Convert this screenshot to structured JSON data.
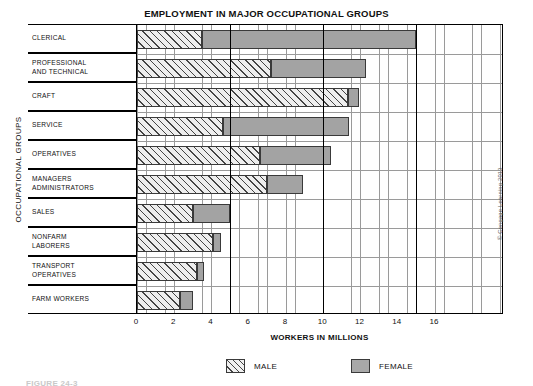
{
  "chart_data": {
    "type": "bar",
    "orientation": "horizontal",
    "title": "EMPLOYMENT IN MAJOR OCCUPATIONAL GROUPS",
    "xlabel": "WORKERS IN MILLIONS",
    "ylabel": "OCCUPATIONAL GROUPS",
    "xlim": [
      0,
      19.7
    ],
    "xticks": [
      0,
      2,
      4,
      6,
      8,
      10,
      12,
      14,
      16
    ],
    "xtick_labels": [
      "0",
      "2",
      "4",
      "6",
      "8",
      "10",
      "12",
      "14",
      "16"
    ],
    "major_gridlines": [
      5,
      10,
      15
    ],
    "minor_gridline_step": 0.5,
    "grid": true,
    "legend_position": "bottom",
    "categories": [
      "CLERICAL",
      "PROFESSIONAL\nAND TECHNICAL",
      "CRAFT",
      "SERVICE",
      "OPERATIVES",
      "MANAGERS\nADMINISTRATORS",
      "SALES",
      "NONFARM\nLABORERS",
      "TRANSPORT\nOPERATIVES",
      "FARM WORKERS"
    ],
    "series": [
      {
        "name": "MALE",
        "color": "#eeeeee",
        "pattern": "diagonal-hatch",
        "values": [
          3.5,
          7.2,
          11.3,
          4.6,
          6.6,
          7.0,
          3.0,
          4.1,
          3.2,
          2.3
        ]
      },
      {
        "name": "FEMALE",
        "color": "#a3a3a3",
        "pattern": "solid-gray",
        "values": [
          15.0,
          12.3,
          11.9,
          11.4,
          10.4,
          8.9,
          5.0,
          4.5,
          3.6,
          3.0
        ]
      }
    ],
    "note": "Female bars are cumulative totals drawn from 0; male segment overlays the left portion of each row."
  },
  "legend": {
    "items": [
      {
        "label": "MALE",
        "swatch": "diagonal-hatch"
      },
      {
        "label": "FEMALE",
        "swatch": "solid-gray"
      }
    ]
  },
  "copyright": "© Cengage Learning 2013",
  "bottom_caption": "FIGURE 24-3"
}
